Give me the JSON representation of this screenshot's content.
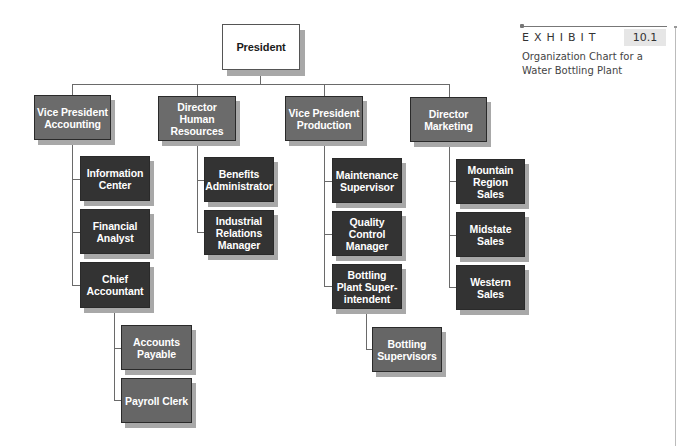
{
  "exhibit": {
    "label": "EXHIBIT",
    "number": "10.1",
    "caption": "Organization Chart for a Water Bottling Plant"
  },
  "chart": {
    "root": "President",
    "departments": [
      {
        "title": "Vice President Accounting",
        "reports": [
          "Information Center",
          "Financial Analyst",
          {
            "title": "Chief Accountant",
            "reports": [
              "Accounts Payable",
              "Payroll Clerk"
            ]
          }
        ]
      },
      {
        "title": "Director Human Resources",
        "reports": [
          "Benefits Administrator",
          "Industrial Relations Manager"
        ]
      },
      {
        "title": "Vice President Production",
        "reports": [
          "Maintenance Supervisor",
          "Quality Control Manager",
          {
            "title": "Bottling Plant Super- intendent",
            "reports": [
              "Bottling Supervisors"
            ]
          }
        ]
      },
      {
        "title": "Director Marketing",
        "reports": [
          "Mountain Region Sales",
          "Midstate Sales",
          "Western Sales"
        ]
      }
    ]
  },
  "labels": {
    "president": "President",
    "vp_accounting": "Vice President Accounting",
    "dir_hr": "Director Human Resources",
    "vp_production": "Vice President Production",
    "dir_marketing": "Director Marketing",
    "information_center": "Information Center",
    "financial_analyst": "Financial Analyst",
    "chief_accountant": "Chief Accountant",
    "accounts_payable": "Accounts Payable",
    "payroll_clerk": "Payroll Clerk",
    "benefits_administrator": "Benefits Administrator",
    "industrial_relations_manager": "Industrial Relations Manager",
    "maintenance_supervisor": "Maintenance Supervisor",
    "quality_control_manager": "Quality Control Manager",
    "bottling_plant_superintendent": "Bottling Plant Super- intendent",
    "bottling_supervisors": "Bottling Supervisors",
    "mountain_region_sales": "Mountain Region Sales",
    "midstate_sales": "Midstate Sales",
    "western_sales": "Western Sales"
  },
  "colors": {
    "level1_fill": "#6b6b6b",
    "level2_fill": "#333333",
    "level3_fill": "#666666",
    "shadow": "#a8a8a8",
    "connector": "#6a6a6a"
  }
}
